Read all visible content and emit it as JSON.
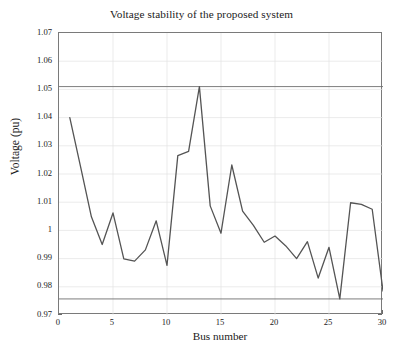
{
  "chart_data": {
    "type": "line",
    "title": "Voltage stability of the proposed system",
    "xlabel": "Bus number",
    "ylabel": "Voltage (pu)",
    "xlim": [
      0,
      30
    ],
    "ylim": [
      0.97,
      1.07
    ],
    "xticks": [
      0,
      5,
      10,
      15,
      20,
      25,
      30
    ],
    "xtick_labels": [
      "0",
      "5",
      "10",
      "15",
      "20",
      "25",
      "30"
    ],
    "yticks": [
      0.97,
      0.98,
      0.99,
      1.0,
      1.01,
      1.02,
      1.03,
      1.04,
      1.05,
      1.06,
      1.07
    ],
    "ytick_labels": [
      "0.97",
      "0.98",
      "0.99",
      "1",
      "1.01",
      "1.02",
      "1.03",
      "1.04",
      "1.05",
      "1.06",
      "1.07"
    ],
    "grid": true,
    "legend": null,
    "series": [
      {
        "name": "Voltage profile",
        "color": "#545454",
        "x": [
          1,
          2,
          3,
          4,
          5,
          6,
          7,
          8,
          9,
          10,
          11,
          12,
          13,
          14,
          15,
          16,
          17,
          18,
          19,
          20,
          21,
          22,
          23,
          24,
          25,
          26,
          27,
          28,
          29,
          30
        ],
        "values": [
          1.04,
          1.0225,
          1.0048,
          0.995,
          1.0062,
          0.9899,
          0.9891,
          0.9931,
          1.0034,
          0.9876,
          1.0265,
          1.028,
          1.051,
          1.0087,
          0.999,
          1.0232,
          1.0068,
          1.0018,
          0.9958,
          0.998,
          0.9945,
          0.99,
          0.996,
          0.9831,
          0.994,
          0.9757,
          1.0098,
          1.0092,
          1.0075,
          0.9785
        ]
      }
    ],
    "annotations": [
      {
        "name": "v-max-limit",
        "label_main": "V",
        "label_sub": "max",
        "value": 1.051,
        "line_color": "#6f6f6f",
        "label_x": 13
      },
      {
        "name": "v-min-limit",
        "label_main": "V",
        "label_sub": "min",
        "value": 0.9757,
        "line_color": "#6f6f6f",
        "label_x": 15
      }
    ]
  }
}
